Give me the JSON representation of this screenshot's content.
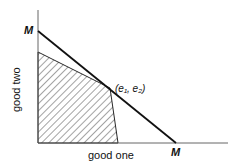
{
  "diagram": {
    "axes": {
      "x_label": "good one",
      "y_label": "good two"
    },
    "budget_line": {
      "y_intercept_label": "M",
      "x_intercept_label": "M"
    },
    "endowment_point": {
      "label": "(e₁, e₂)"
    },
    "shaded_region": "feasible set (hatched)",
    "colors": {
      "line": "#111111",
      "hatch": "#333333",
      "background": "#ffffff"
    }
  }
}
